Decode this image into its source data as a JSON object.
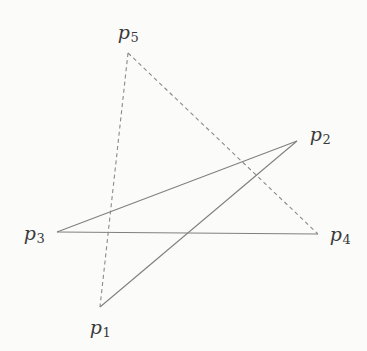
{
  "figure": {
    "background_color": "#fbfbf9",
    "width": 367,
    "height": 351,
    "stroke_color": "#808080",
    "label_color": "#3a3a3a"
  },
  "diagram_data": {
    "type": "node-link-diagram",
    "description": "Five labeled points connected by three solid segments and two dashed segments",
    "nodes": [
      {
        "id": "p1",
        "label_base": "p",
        "label_sub": "1",
        "x": 100,
        "y": 307,
        "label_x": 100,
        "label_y": 327
      },
      {
        "id": "p2",
        "label_base": "p",
        "label_sub": "2",
        "x": 297,
        "y": 141,
        "label_x": 320,
        "label_y": 134
      },
      {
        "id": "p3",
        "label_base": "p",
        "label_sub": "3",
        "x": 57,
        "y": 232,
        "label_x": 34,
        "label_y": 233
      },
      {
        "id": "p4",
        "label_base": "p",
        "label_sub": "4",
        "x": 318,
        "y": 234,
        "label_x": 340,
        "label_y": 234
      },
      {
        "id": "p5",
        "label_base": "p",
        "label_sub": "5",
        "x": 128,
        "y": 53,
        "label_x": 128,
        "label_y": 32
      }
    ],
    "edges": [
      {
        "id": "edge-p3-p2",
        "from": "p3",
        "to": "p2",
        "style": "solid",
        "x1": 57,
        "y1": 232,
        "x2": 297,
        "y2": 141
      },
      {
        "id": "edge-p3-p4",
        "from": "p3",
        "to": "p4",
        "style": "solid",
        "x1": 57,
        "y1": 232,
        "x2": 318,
        "y2": 234
      },
      {
        "id": "edge-p1-p2",
        "from": "p1",
        "to": "p2",
        "style": "solid",
        "x1": 100,
        "y1": 307,
        "x2": 297,
        "y2": 141
      },
      {
        "id": "edge-p5-p1",
        "from": "p5",
        "to": "p1",
        "style": "dashed",
        "x1": 128,
        "y1": 53,
        "x2": 100,
        "y2": 307
      },
      {
        "id": "edge-p5-p4",
        "from": "p5",
        "to": "p4",
        "style": "dashed",
        "x1": 128,
        "y1": 53,
        "x2": 318,
        "y2": 234
      }
    ]
  }
}
